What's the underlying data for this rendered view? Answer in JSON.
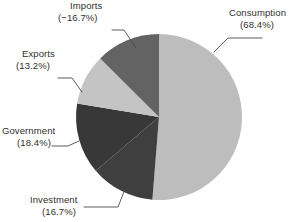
{
  "chart_data": {
    "type": "pie",
    "title": "",
    "subtitle": "",
    "xlabel": "",
    "ylabel": "",
    "legend_position": "none",
    "grid": false,
    "start_angle_deg": 90,
    "direction": "clockwise",
    "note": "Imports is a negative share; wedge sizes are drawn from absolute magnitudes.",
    "categories": [
      "Consumption",
      "Investment",
      "Government",
      "Exports",
      "Imports"
    ],
    "values": [
      68.4,
      16.7,
      18.4,
      13.2,
      -16.7
    ],
    "labels": [
      "(68.4%)",
      "(16.7%)",
      "(18.4%)",
      "(13.2%)",
      "(−16.7%)"
    ],
    "colors": [
      "#bdbdbd",
      "#3f3f3f",
      "#383838",
      "#c4c4c4",
      "#636363"
    ],
    "slices": [
      {
        "name": "Consumption",
        "value": 68.4,
        "value_label": "(68.4%)",
        "color": "#bdbdbd"
      },
      {
        "name": "Investment",
        "value": 16.7,
        "value_label": "(16.7%)",
        "color": "#3f3f3f"
      },
      {
        "name": "Government",
        "value": 18.4,
        "value_label": "(18.4%)",
        "color": "#383838"
      },
      {
        "name": "Exports",
        "value": 13.2,
        "value_label": "(13.2%)",
        "color": "#c4c4c4"
      },
      {
        "name": "Imports",
        "value": -16.7,
        "value_label": "(−16.7%)",
        "color": "#636363"
      }
    ]
  },
  "callouts": {
    "consumption": {
      "name": "Consumption",
      "value": "(68.4%)"
    },
    "imports": {
      "name": "Imports",
      "value": "(−16.7%)"
    },
    "exports": {
      "name": "Exports",
      "value": "(13.2%)"
    },
    "government": {
      "name": "Government",
      "value": "(18.4%)"
    },
    "investment": {
      "name": "Investment",
      "value": "(16.7%)"
    }
  }
}
